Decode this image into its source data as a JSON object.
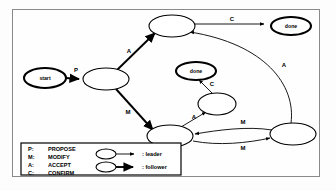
{
  "diagram": {
    "background": "#fdfdfd",
    "frame_color": "#8a8a8a",
    "ink_color": "#000000",
    "nodes": [
      {
        "id": "start",
        "label": "start",
        "style": "bold",
        "cx": 45,
        "cy": 78,
        "rx": 21,
        "ry": 10
      },
      {
        "id": "s_center",
        "label": "",
        "style": "plain",
        "cx": 106,
        "cy": 79,
        "rx": 23,
        "ry": 11
      },
      {
        "id": "s_top",
        "label": "",
        "style": "plain",
        "cx": 172,
        "cy": 26,
        "rx": 23,
        "ry": 11
      },
      {
        "id": "done_top",
        "label": "done",
        "style": "bold",
        "cx": 291,
        "cy": 26,
        "rx": 20,
        "ry": 9
      },
      {
        "id": "done_mid",
        "label": "done",
        "style": "bold",
        "cx": 196,
        "cy": 71,
        "rx": 20,
        "ry": 9
      },
      {
        "id": "s_mid",
        "label": "",
        "style": "plain",
        "cx": 217,
        "cy": 104,
        "rx": 19,
        "ry": 11
      },
      {
        "id": "s_bottom",
        "label": "",
        "style": "plain",
        "cx": 170,
        "cy": 136,
        "rx": 23,
        "ry": 11
      },
      {
        "id": "s_right",
        "label": "",
        "style": "plain",
        "cx": 293,
        "cy": 134,
        "rx": 23,
        "ry": 11
      }
    ],
    "edges": [
      {
        "id": "start-center",
        "label": "P",
        "kind": "follower",
        "label_x": 76,
        "label_y": 70
      },
      {
        "id": "center-top",
        "label": "A",
        "kind": "follower",
        "label_x": 129,
        "label_y": 51
      },
      {
        "id": "center-bottom",
        "label": "M",
        "kind": "follower",
        "label_x": 128,
        "label_y": 112
      },
      {
        "id": "top-donetop",
        "label": "C",
        "kind": "leader",
        "label_x": 232,
        "label_y": 19
      },
      {
        "id": "right-top",
        "label": "A",
        "kind": "leader",
        "label_x": 284,
        "label_y": 65
      },
      {
        "id": "bottom-mid",
        "label": "A",
        "kind": "leader",
        "label_x": 194,
        "label_y": 117
      },
      {
        "id": "mid-donemid",
        "label": "C",
        "kind": "leader",
        "label_x": 212,
        "label_y": 84
      },
      {
        "id": "right-bottom",
        "label": "M",
        "kind": "leader",
        "label_x": 243,
        "label_y": 122
      },
      {
        "id": "bottom-right",
        "label": "M",
        "kind": "leader",
        "label_x": 243,
        "label_y": 148
      }
    ]
  },
  "legend": {
    "abbreviations": [
      {
        "key": "P:",
        "term": "PROPOSE"
      },
      {
        "key": "M:",
        "term": "MODIFY"
      },
      {
        "key": "A:",
        "term": "ACCEPT"
      },
      {
        "key": "C:",
        "term": "CONFIRM"
      }
    ],
    "edge_kinds": [
      {
        "kind": "leader",
        "label": ": leader"
      },
      {
        "kind": "follower",
        "label": ": follower"
      }
    ]
  }
}
